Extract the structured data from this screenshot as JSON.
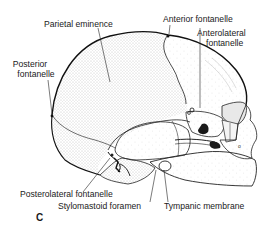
{
  "figure": {
    "panel_letter": "C",
    "labels": {
      "parietal_eminence": "Parietal eminence",
      "posterior_fontanelle_1": "Posterior",
      "posterior_fontanelle_2": "fontanelle",
      "anterior_fontanelle": "Anterior fontanelle",
      "anterolateral_fontanelle_1": "Anterolateral",
      "anterolateral_fontanelle_2": "fontanelle",
      "posterolateral_fontanelle": "Posterolateral fontanelle",
      "stylomastoid_foramen": "Stylomastoid foramen",
      "tympanic_membrane": "Tympanic membrane"
    },
    "colors": {
      "ink": "#1a1a1a",
      "stipple": "#9a9a9a",
      "background": "#ffffff"
    }
  }
}
